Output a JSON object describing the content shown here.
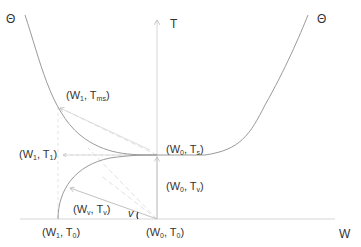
{
  "diagram": {
    "axes": {
      "x_label": "W",
      "y_label": "T"
    },
    "curve_labels": {
      "left": "Θ",
      "right": "Θ"
    },
    "points": [
      {
        "id": "w1_tms",
        "main": "(W",
        "sub1": "1",
        "mid": ", T",
        "sub2": "ms",
        "end": ")"
      },
      {
        "id": "w1_t1",
        "main": "(W",
        "sub1": "1",
        "mid": ", T",
        "sub2": "1",
        "end": ")"
      },
      {
        "id": "w0_ts",
        "main": "(W",
        "sub1": "0",
        "mid": ", T",
        "sub2": "s",
        "end": ")"
      },
      {
        "id": "w0_tv",
        "main": "(W",
        "sub1": "0",
        "mid": ", T",
        "sub2": "v",
        "end": ")"
      },
      {
        "id": "wv_tv",
        "main": "(W",
        "sub1": "v",
        "mid": ", T",
        "sub2": "v",
        "end": ")"
      },
      {
        "id": "w1_t0",
        "main": "(W",
        "sub1": "1",
        "mid": ", T",
        "sub2": "0",
        "end": ")"
      },
      {
        "id": "w0_t0",
        "main": "(W",
        "sub1": "0",
        "mid": ", T",
        "sub2": "0",
        "end": ")"
      }
    ],
    "angle_label": "v",
    "colors": {
      "curve": "#9a9a9a",
      "axis": "#cfcfcf",
      "dashed": "#d8d8d8",
      "arrow": "#b8b8b8",
      "text": "#333333"
    }
  }
}
